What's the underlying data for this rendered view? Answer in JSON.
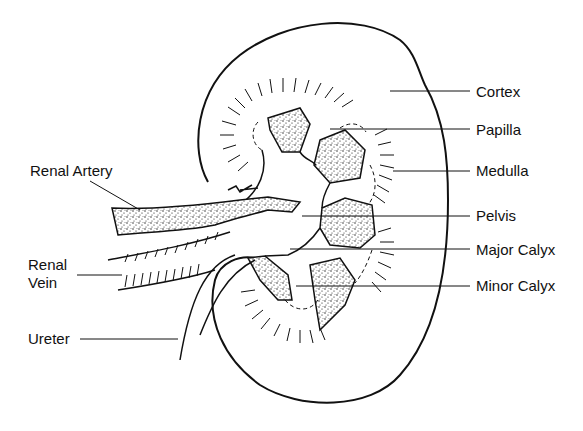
{
  "diagram": {
    "colors": {
      "ink": "#111111",
      "background": "#ffffff"
    },
    "labels_right": [
      {
        "id": "cortex",
        "text": "Cortex",
        "x": 476,
        "y": 83
      },
      {
        "id": "papilla",
        "text": "Papilla",
        "x": 476,
        "y": 121
      },
      {
        "id": "medulla",
        "text": "Medulla",
        "x": 476,
        "y": 162
      },
      {
        "id": "pelvis",
        "text": "Pelvis",
        "x": 476,
        "y": 207
      },
      {
        "id": "major-calyx",
        "text": "Major Calyx",
        "x": 476,
        "y": 241
      },
      {
        "id": "minor-calyx",
        "text": "Minor Calyx",
        "x": 476,
        "y": 277
      }
    ],
    "labels_left": [
      {
        "id": "renal-artery",
        "text": "Renal Artery",
        "x": 30,
        "y": 162
      },
      {
        "id": "renal-vein-1",
        "text": "Renal",
        "x": 28,
        "y": 256
      },
      {
        "id": "renal-vein-2",
        "text": "Vein",
        "x": 28,
        "y": 274
      },
      {
        "id": "ureter",
        "text": "Ureter",
        "x": 28,
        "y": 330
      }
    ]
  }
}
